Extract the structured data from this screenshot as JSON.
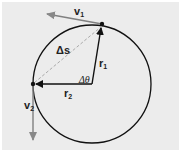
{
  "diagram": {
    "background": "#e8e8e8",
    "labels": {
      "v1": "v",
      "v1_sub": "1",
      "v2": "v",
      "v2_sub": "2",
      "r1": "r",
      "r1_sub": "1",
      "r2": "r",
      "r2_sub": "2",
      "ds": "Δs",
      "dtheta": "Δθ"
    },
    "colors": {
      "circle": "#111111",
      "radius": "#111111",
      "velocity": "#808080",
      "chord": "#999999"
    }
  }
}
